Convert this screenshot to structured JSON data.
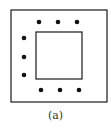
{
  "figure": {
    "caption": "(a)",
    "outer_square": {
      "x": 11,
      "y": 10,
      "w": 96,
      "h": 92
    },
    "inner_square": {
      "x": 36,
      "y": 32,
      "w": 46,
      "h": 47
    },
    "dots": {
      "top": [
        [
          39,
          22
        ],
        [
          58,
          22
        ],
        [
          77,
          22
        ]
      ],
      "left": [
        [
          24,
          38
        ],
        [
          24,
          57
        ],
        [
          24,
          75
        ]
      ],
      "bottom": [
        [
          41,
          90
        ],
        [
          60,
          90
        ],
        [
          79,
          90
        ]
      ]
    },
    "colors": {
      "stroke": "#1a1a1a",
      "dot": "#111111"
    }
  }
}
